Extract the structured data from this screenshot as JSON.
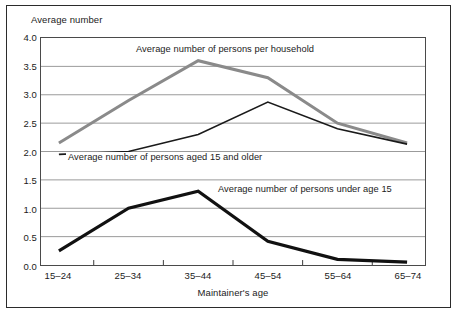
{
  "chart_data": {
    "type": "line",
    "title": "",
    "xlabel": "Maintainer's age",
    "ylabel": "Average number",
    "categories": [
      "15–24",
      "25–34",
      "35–44",
      "45–54",
      "55–64",
      "65–74"
    ],
    "ylim": [
      0.0,
      4.0
    ],
    "ytick_labels": [
      "0.0",
      "0.5",
      "1.0",
      "1.5",
      "2.0",
      "2.5",
      "3.0",
      "3.5",
      "4.0"
    ],
    "ytick_values": [
      0.0,
      0.5,
      1.0,
      1.5,
      2.0,
      2.5,
      3.0,
      3.5,
      4.0
    ],
    "grid": true,
    "legend_position": "inline-annotations",
    "series": [
      {
        "name": "Average number of persons per household",
        "color": "#8a8a8a",
        "width": 3.0,
        "values": [
          2.15,
          2.9,
          3.6,
          3.3,
          2.5,
          2.15
        ]
      },
      {
        "name": "Average number of persons aged 15 and older",
        "color": "#1a1a1a",
        "width": 1.6,
        "values": [
          1.95,
          2.0,
          2.3,
          2.87,
          2.4,
          2.13
        ]
      },
      {
        "name": "Average number of persons under age 15",
        "color": "#111111",
        "width": 3.2,
        "values": [
          0.25,
          1.0,
          1.3,
          0.42,
          0.1,
          0.05
        ]
      }
    ],
    "annotations": [
      {
        "text": "Average number of persons per household",
        "x_px": 134,
        "y_px": 44
      },
      {
        "text": "Average number of persons aged 15 and older",
        "x_px": 66,
        "y_px": 152
      },
      {
        "text": "Average number of persons under age 15",
        "x_px": 216,
        "y_px": 184
      }
    ]
  },
  "figure": {
    "y_axis_title": "Average number",
    "x_axis_title": "Maintainer's age"
  }
}
